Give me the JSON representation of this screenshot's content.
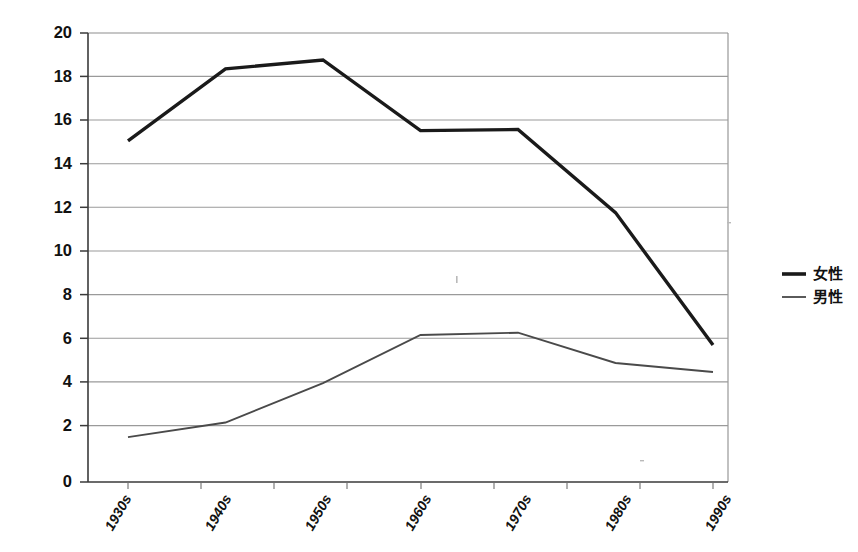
{
  "chart_data": {
    "type": "line",
    "title": "",
    "subtitle": "",
    "xlabel": "",
    "ylabel": "",
    "categories": [
      "1930s",
      "1940s",
      "1950s",
      "1960s",
      "1970s",
      "1980s",
      "1990s"
    ],
    "series": [
      {
        "name": "女性",
        "values": [
          15.2,
          18.4,
          18.8,
          15.65,
          15.7,
          12.0,
          6.1
        ],
        "color": "#1a1a1a",
        "line_width": "thick"
      },
      {
        "name": "男性",
        "values": [
          2.0,
          2.65,
          4.4,
          6.55,
          6.65,
          5.3,
          4.9
        ],
        "color": "#4a4a4a",
        "line_width": "thin"
      }
    ],
    "ylim": [
      0,
      20
    ],
    "ytick_step": 2,
    "ytick_labels": [
      "0",
      "2",
      "4",
      "6",
      "8",
      "10",
      "12",
      "14",
      "16",
      "18",
      "20"
    ],
    "grid": "horizontal",
    "legend_position": "right",
    "xtick_rotation": -60
  },
  "legend": {
    "items": [
      {
        "label": "女性",
        "style": "thick-line",
        "icon": "line-swatch-icon"
      },
      {
        "label": "男性",
        "style": "thin-line",
        "icon": "line-swatch-icon"
      }
    ]
  },
  "axes": {
    "y_axis_name": "y-axis",
    "x_axis_name": "x-axis"
  }
}
